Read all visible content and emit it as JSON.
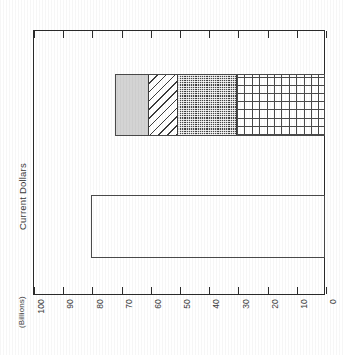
{
  "chart_data": {
    "type": "bar",
    "orientation": "horizontal-rotated",
    "title": "",
    "subtitle": "",
    "xlabel": "",
    "ylabel": "Current Dollars",
    "units_label": "(Billions)",
    "axis_range": [
      0,
      100
    ],
    "axis_direction": "descending",
    "tick_labels": [
      "100",
      "90",
      "80",
      "70",
      "60",
      "50",
      "40",
      "30",
      "20",
      "10",
      "0"
    ],
    "tick_values": [
      100,
      90,
      80,
      70,
      60,
      50,
      40,
      30,
      20,
      10,
      0
    ],
    "grid": false,
    "legend": false,
    "legend_position": "none",
    "categories": [
      "Total",
      "Components"
    ],
    "bars": [
      {
        "name": "total-bar",
        "category": "Total",
        "value": 80,
        "pattern": "open-outline",
        "fill": "#ffffff",
        "stroke": "#4a4a4a"
      },
      {
        "name": "stacked-bar",
        "category": "Components",
        "value": 72,
        "stacked": true,
        "segments": [
          {
            "name": "segment-1",
            "value": 12,
            "start": 72,
            "end": 60,
            "pattern": "solid-gray",
            "fill": "#d4d4d4"
          },
          {
            "name": "segment-2",
            "value": 10,
            "start": 60,
            "end": 50,
            "pattern": "diagonal",
            "fill": "#ffffff"
          },
          {
            "name": "segment-3",
            "value": 20,
            "start": 50,
            "end": 30,
            "pattern": "checker-dark",
            "fill": "#3a3a3a"
          },
          {
            "name": "segment-4",
            "value": 30,
            "start": 30,
            "end": 0,
            "pattern": "grid",
            "fill": "#ffffff"
          }
        ]
      }
    ]
  },
  "axis": {
    "y_title": "Current Dollars",
    "units": "(Billions)",
    "ticks": [
      "100",
      "90",
      "80",
      "70",
      "60",
      "50",
      "40",
      "30",
      "20",
      "10",
      "0"
    ]
  },
  "colors": {
    "frame": "#2b2b2b",
    "bar_stroke": "#4a4a4a",
    "segment_gray": "#d4d4d4",
    "segment_dark": "#3a3a3a",
    "background": "#ffffff",
    "text": "#3a3a3a"
  }
}
